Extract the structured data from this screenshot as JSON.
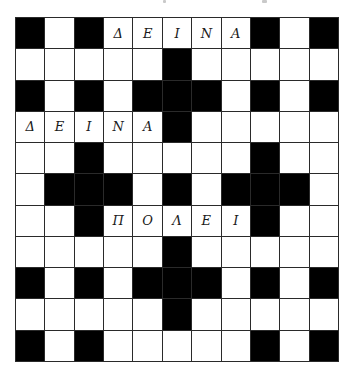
{
  "puzzle": {
    "rows": 11,
    "cols": 11,
    "colors": {
      "block": "#000000",
      "cell": "#ffffff",
      "line": "#2a2a2a",
      "letter": "#1a1a1a"
    },
    "grid": [
      [
        "#",
        "",
        "#",
        "Δ",
        "Ε",
        "Ι",
        "Ν",
        "Α",
        "#",
        "",
        "#"
      ],
      [
        "",
        "",
        "",
        "",
        "",
        "#",
        "",
        "",
        "",
        "",
        ""
      ],
      [
        "#",
        "",
        "#",
        "",
        "#",
        "#",
        "#",
        "",
        "#",
        "",
        "#"
      ],
      [
        "Δ",
        "Ε",
        "Ι",
        "Ν",
        "Α",
        "#",
        "",
        "",
        "",
        "",
        ""
      ],
      [
        "",
        "",
        "#",
        "",
        "",
        "",
        "",
        "",
        "#",
        "",
        ""
      ],
      [
        "",
        "#",
        "#",
        "#",
        "",
        "#",
        "",
        "#",
        "#",
        "#",
        ""
      ],
      [
        "",
        "",
        "#",
        "Π",
        "Ο",
        "Λ",
        "Ε",
        "Ι",
        "#",
        "",
        ""
      ],
      [
        "",
        "",
        "",
        "",
        "",
        "#",
        "",
        "",
        "",
        "",
        ""
      ],
      [
        "#",
        "",
        "#",
        "",
        "#",
        "#",
        "#",
        "",
        "#",
        "",
        "#"
      ],
      [
        "",
        "",
        "",
        "",
        "",
        "#",
        "",
        "",
        "",
        "",
        ""
      ],
      [
        "#",
        "",
        "#",
        "",
        "",
        "",
        "",
        "",
        "#",
        "",
        "#"
      ]
    ],
    "filled_words": [
      {
        "word": "ΔΕΙΝΑ",
        "row": 0,
        "col": 3,
        "direction": "across"
      },
      {
        "word": "ΔΕΙΝΑ",
        "row": 3,
        "col": 0,
        "direction": "across"
      },
      {
        "word": "ΠΟΛΕΙ",
        "row": 6,
        "col": 3,
        "direction": "across"
      }
    ]
  }
}
